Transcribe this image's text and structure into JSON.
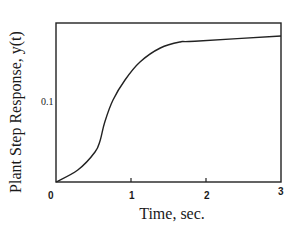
{
  "chart_data": {
    "type": "line",
    "title": "",
    "xlabel": "Time, sec.",
    "ylabel": "Plant Step Response, y(t)",
    "xlim": [
      0,
      3
    ],
    "ylim": [
      0,
      0.1987
    ],
    "x_ticks": [
      "0",
      "1",
      "2",
      "3"
    ],
    "y_ticks": [
      "0.1"
    ],
    "grid": false,
    "legend": null,
    "series": [
      {
        "name": "y(t)",
        "x": [
          0,
          0.29,
          0.52,
          0.59,
          0.65,
          0.76,
          0.92,
          1.12,
          1.39,
          1.65,
          1.85,
          3.0
        ],
        "values": [
          0,
          0.015,
          0.0375,
          0.0525,
          0.075,
          0.1025,
          0.1275,
          0.15,
          0.1675,
          0.175,
          0.176,
          0.1825
        ]
      }
    ]
  },
  "labels": {
    "x_axis": "Time, sec.",
    "y_axis": "Plant Step Response, y(t)",
    "x_tick_0": "0",
    "x_tick_1": "1",
    "x_tick_2": "2",
    "x_tick_3": "3",
    "y_tick_01": "0.1"
  }
}
